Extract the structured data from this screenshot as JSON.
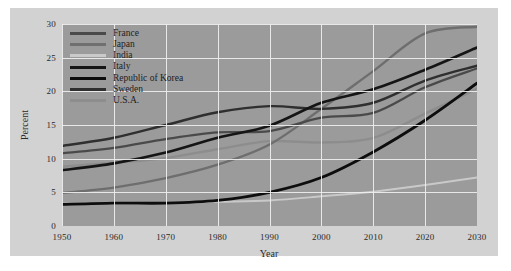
{
  "chart_data": {
    "type": "line",
    "title": "",
    "xlabel": "Year",
    "ylabel": "Percent",
    "xlim": [
      1950,
      2030
    ],
    "ylim": [
      0,
      30
    ],
    "xticks": [
      1950,
      1960,
      1970,
      1980,
      1990,
      2000,
      2010,
      2020,
      2030
    ],
    "yticks": [
      0,
      5,
      10,
      15,
      20,
      25,
      30
    ],
    "grid": true,
    "legend_position": "top-left",
    "x": [
      1950,
      1960,
      1970,
      1980,
      1990,
      2000,
      2010,
      2020,
      2030
    ],
    "series": [
      {
        "name": "France",
        "color": "#4a4a4a",
        "width": 2.2,
        "values": [
          10.8,
          11.6,
          12.9,
          13.9,
          14.1,
          16.1,
          16.8,
          20.6,
          23.4
        ]
      },
      {
        "name": "Japan",
        "color": "#6e6e6e",
        "width": 2.4,
        "values": [
          4.9,
          5.7,
          7.1,
          9.1,
          12.1,
          17.4,
          23.0,
          28.6,
          29.6
        ]
      },
      {
        "name": "India",
        "color": "#c9c9c9",
        "width": 2.0,
        "values": [
          3.3,
          3.3,
          3.4,
          3.6,
          3.8,
          4.4,
          5.1,
          6.1,
          7.2
        ]
      },
      {
        "name": "Italy",
        "color": "#151515",
        "width": 2.6,
        "values": [
          8.3,
          9.3,
          10.9,
          13.1,
          14.9,
          18.3,
          20.3,
          23.2,
          26.5
        ]
      },
      {
        "name": "Republic of Korea",
        "color": "#0d0d0d",
        "width": 2.8,
        "values": [
          3.2,
          3.4,
          3.4,
          3.8,
          5.0,
          7.2,
          11.0,
          15.7,
          21.2
        ]
      },
      {
        "name": "Sweden",
        "color": "#2f2f2f",
        "width": 2.4,
        "values": [
          11.9,
          13.1,
          15.0,
          16.9,
          17.8,
          17.4,
          18.3,
          21.6,
          23.8
        ]
      },
      {
        "name": "U.S.A.",
        "color": "#8d8d8d",
        "width": 2.4,
        "values": [
          8.8,
          9.4,
          10.1,
          11.4,
          12.6,
          12.4,
          13.1,
          16.7,
          20.4
        ]
      }
    ]
  },
  "legend": {
    "entries": [
      {
        "label": "France",
        "swatch": "#4a4a4a"
      },
      {
        "label": "Japan",
        "swatch": "#707070"
      },
      {
        "label": "India",
        "swatch": "#c9c9c9"
      },
      {
        "label": "Italy",
        "swatch": "#151515"
      },
      {
        "label": "Republic of Korea",
        "swatch": "#0d0d0d"
      },
      {
        "label": "Sweden",
        "swatch": "#2f2f2f"
      },
      {
        "label": "U.S.A.",
        "swatch": "#8d8d8d"
      }
    ]
  },
  "axes": {
    "y_label": "Percent",
    "x_label": "Year",
    "y_ticks": [
      "0",
      "5",
      "10",
      "15",
      "20",
      "25",
      "30"
    ],
    "x_ticks": [
      "1950",
      "1960",
      "1970",
      "1980",
      "1990",
      "2000",
      "2010",
      "2020",
      "2030"
    ]
  },
  "style": {
    "page_background": "#ffffff",
    "card_background": "#d2d2d2",
    "plot_background": "#9b9b9b",
    "grid_color": "#efefef",
    "text_color": "#2a2a2a"
  }
}
